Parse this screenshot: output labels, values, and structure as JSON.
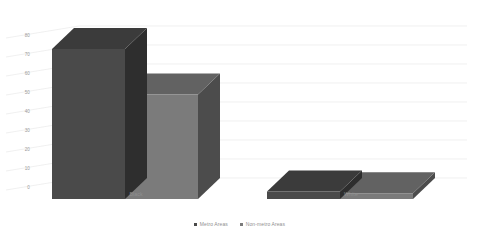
{
  "chart_data": {
    "type": "bar",
    "title": "",
    "subtitle": "",
    "xlabel": "",
    "ylabel": "",
    "categories": [
      "Black",
      "White"
    ],
    "series": [
      {
        "name": "Metro Areas",
        "values": [
          79,
          4
        ],
        "color": "#4a4a4a"
      },
      {
        "name": "Non-metro Areas",
        "values": [
          55,
          3
        ],
        "color": "#7b7b7b"
      }
    ],
    "ylim": [
      0,
      80
    ],
    "ytick_labels": [
      "80",
      "70",
      "60",
      "50",
      "40",
      "30",
      "20",
      "10",
      "0"
    ],
    "ytick_values": [
      80,
      70,
      60,
      50,
      40,
      30,
      20,
      10,
      0
    ],
    "grid": true,
    "grid_color": "#e9e9e9",
    "legend_position": "bottom",
    "style": "3d-column",
    "background": "#ffffff"
  },
  "legend": {
    "items": [
      {
        "label": "Metro Areas",
        "color": "#4a4a4a"
      },
      {
        "label": "Non-metro Areas",
        "color": "#7b7b7b"
      }
    ]
  },
  "axis": {
    "y_labels": [
      "80",
      "70",
      "60",
      "50",
      "40",
      "30",
      "20",
      "10",
      "0"
    ],
    "x_labels": [
      "Black",
      "White"
    ]
  }
}
